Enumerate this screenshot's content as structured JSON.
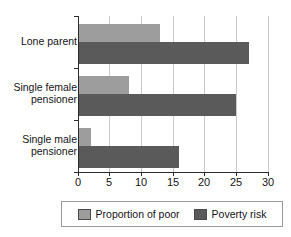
{
  "chart_data": {
    "type": "bar",
    "orientation": "horizontal",
    "title": "",
    "xlabel": "",
    "ylabel": "",
    "xlim": [
      0,
      30
    ],
    "xticks": [
      0,
      5,
      10,
      15,
      20,
      25,
      30
    ],
    "grid": "vertical",
    "legend_position": "bottom",
    "categories": [
      "Lone parent",
      "Single female\npensioner",
      "Single male\npensioner"
    ],
    "series": [
      {
        "name": "Proportion of poor",
        "color": "#9d9d9d",
        "values": [
          13,
          8,
          2
        ]
      },
      {
        "name": "Poverty risk",
        "color": "#5a5a5a",
        "values": [
          27,
          25,
          16
        ]
      }
    ]
  },
  "axis": {
    "tick_labels": [
      "0",
      "5",
      "10",
      "15",
      "20",
      "25",
      "30"
    ]
  },
  "legend": {
    "entries": [
      {
        "label": "Proportion of poor",
        "color": "#9d9d9d"
      },
      {
        "label": "Poverty risk",
        "color": "#5a5a5a"
      }
    ]
  },
  "colors": {
    "light_bar": "#9d9d9d",
    "dark_bar": "#5a5a5a",
    "gridline": "#c9c9c9",
    "axis": "#2b2b2b",
    "background": "#ffffff"
  }
}
